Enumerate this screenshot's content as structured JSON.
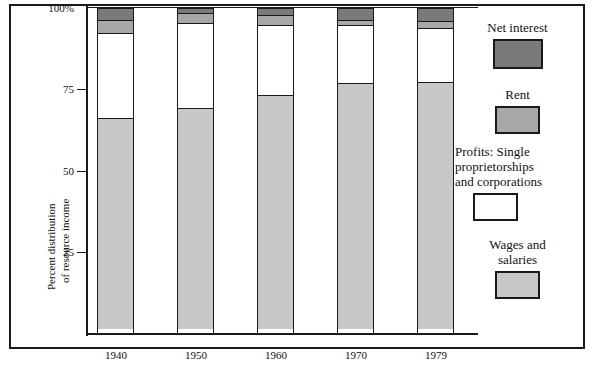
{
  "chart_data": {
    "type": "bar",
    "subtype": "stacked-bar-100pct",
    "title": "",
    "xlabel": "",
    "ylabel": "Percent distribution of resource income",
    "ylim": [
      0,
      100
    ],
    "yticks": [
      25,
      50,
      75,
      100
    ],
    "ytick_labels": [
      "25",
      "50",
      "75",
      "100%"
    ],
    "grid": false,
    "legend_position": "right",
    "categories": [
      "1940",
      "1950",
      "1960",
      "1970",
      "1979"
    ],
    "series": [
      {
        "name": "Wages and salaries",
        "color": "#c8c8c8",
        "values": [
          65,
          68,
          72,
          75.5,
          76
        ]
      },
      {
        "name": "Profits: Single proprietorships and corporations",
        "color": "#ffffff",
        "values": [
          26.5,
          26.5,
          22,
          18.5,
          17
        ]
      },
      {
        "name": "Rent",
        "color": "#a8a8a8",
        "values": [
          4.5,
          3.5,
          3.5,
          2,
          2.5
        ]
      },
      {
        "name": "Net interest",
        "color": "#7a7a7a",
        "values": [
          4,
          2,
          2.5,
          4,
          4.5
        ]
      }
    ],
    "stack_order_top_to_bottom": [
      "Net interest",
      "Rent",
      "Profits: Single proprietorships and corporations",
      "Wages and salaries"
    ]
  },
  "axis": {
    "y_label_line1": "Percent distribution",
    "y_label_line2": "of resource income",
    "tick_100": "100%",
    "tick_75": "75",
    "tick_50": "50",
    "tick_25": "25"
  },
  "xaxis": {
    "labels": [
      "1940",
      "1950",
      "1960",
      "1970",
      "1979"
    ]
  },
  "legend": {
    "items": [
      {
        "label": "Net interest",
        "color": "#7a7a7a"
      },
      {
        "label": "Rent",
        "color": "#a8a8a8"
      },
      {
        "label_line1": "Profits: Single",
        "label_line2": "proprietorships",
        "label_line3": "and corporations",
        "color": "#ffffff"
      },
      {
        "label_line1": "Wages and",
        "label_line2": "salaries",
        "color": "#c8c8c8"
      }
    ]
  }
}
